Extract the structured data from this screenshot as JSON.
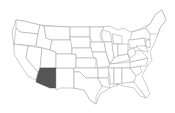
{
  "map": {
    "type": "choropleth",
    "region": "United States",
    "highlighted_state": "Arizona",
    "highlight_color": "#555555",
    "base_color": "#ffffff",
    "border_color": "#9a9a9a"
  }
}
